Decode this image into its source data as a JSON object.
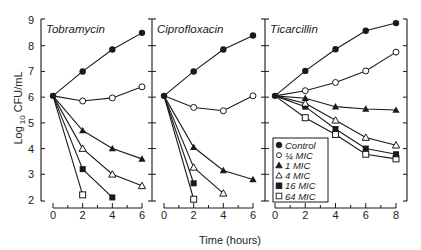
{
  "chart_data": {
    "type": "line",
    "title": "",
    "xlabel": "Time (hours)",
    "ylabel": "Log 10 CFU/mL",
    "ylabel_parts": {
      "prefix": "Log",
      "subscript": "10",
      "suffix": "CFU/mL"
    },
    "ylim": [
      2,
      9
    ],
    "yticks": [
      2,
      3,
      4,
      5,
      6,
      7,
      8,
      9
    ],
    "grid": false,
    "legend_position": "inside lower-left of Ticarcillin panel",
    "series_styles": [
      {
        "name": "Control",
        "marker": "filled-circle"
      },
      {
        "name": "¼ MIC",
        "marker": "open-circle"
      },
      {
        "name": "1 MIC",
        "marker": "filled-triangle"
      },
      {
        "name": "4 MIC",
        "marker": "open-triangle"
      },
      {
        "name": "16 MIC",
        "marker": "filled-square"
      },
      {
        "name": "64 MIC",
        "marker": "open-square"
      }
    ],
    "panels": [
      {
        "title": "Tobramycin",
        "xlim": [
          0,
          6
        ],
        "xticks": [
          0,
          2,
          4,
          6
        ],
        "series": [
          {
            "name": "Control",
            "x": [
              0,
              2,
              4,
              6
            ],
            "values": [
              6.05,
              7.0,
              7.85,
              8.5
            ]
          },
          {
            "name": "¼ MIC",
            "x": [
              0,
              2,
              4,
              6
            ],
            "values": [
              6.05,
              5.85,
              5.97,
              6.4
            ]
          },
          {
            "name": "1 MIC",
            "x": [
              0,
              2,
              4,
              6
            ],
            "values": [
              6.05,
              4.7,
              4.0,
              3.6
            ]
          },
          {
            "name": "4 MIC",
            "x": [
              0,
              2,
              4,
              6
            ],
            "values": [
              6.05,
              4.0,
              3.0,
              2.55
            ]
          },
          {
            "name": "16 MIC",
            "x": [
              0,
              2,
              4
            ],
            "values": [
              6.05,
              3.2,
              2.1
            ]
          },
          {
            "name": "64 MIC",
            "x": [
              0,
              2
            ],
            "values": [
              6.05,
              2.2
            ]
          }
        ]
      },
      {
        "title": "Ciprofloxacin",
        "xlim": [
          0,
          6
        ],
        "xticks": [
          0,
          2,
          4,
          6
        ],
        "series": [
          {
            "name": "Control",
            "x": [
              0,
              2,
              4,
              6
            ],
            "values": [
              6.05,
              7.0,
              7.85,
              8.4
            ]
          },
          {
            "name": "¼ MIC",
            "x": [
              0,
              2,
              4,
              6
            ],
            "values": [
              6.05,
              5.6,
              5.47,
              6.05
            ]
          },
          {
            "name": "1 MIC",
            "x": [
              0,
              2,
              4,
              6
            ],
            "values": [
              6.05,
              4.05,
              3.15,
              2.8
            ]
          },
          {
            "name": "4 MIC",
            "x": [
              0,
              2,
              4
            ],
            "values": [
              6.05,
              3.27,
              2.26
            ]
          },
          {
            "name": "16 MIC",
            "x": [
              0,
              2
            ],
            "values": [
              6.05,
              2.65
            ]
          },
          {
            "name": "64 MIC",
            "x": [
              0,
              2
            ],
            "values": [
              6.05,
              2.03
            ]
          }
        ]
      },
      {
        "title": "Ticarcillin",
        "xlim": [
          0,
          8
        ],
        "xticks": [
          0,
          2,
          4,
          6,
          8
        ],
        "series": [
          {
            "name": "Control",
            "x": [
              0,
              2,
              4,
              6,
              8
            ],
            "values": [
              6.05,
              7.02,
              7.86,
              8.58,
              8.88
            ]
          },
          {
            "name": "¼ MIC",
            "x": [
              0,
              2,
              4,
              6,
              8
            ],
            "values": [
              6.05,
              6.25,
              6.57,
              7.02,
              7.75
            ]
          },
          {
            "name": "1 MIC",
            "x": [
              0,
              2,
              4,
              6,
              8
            ],
            "values": [
              6.05,
              5.96,
              5.63,
              5.54,
              5.5
            ]
          },
          {
            "name": "4 MIC",
            "x": [
              0,
              2,
              4,
              6,
              8
            ],
            "values": [
              6.05,
              5.76,
              5.1,
              4.43,
              4.13
            ]
          },
          {
            "name": "16 MIC",
            "x": [
              0,
              2,
              4,
              6,
              8
            ],
            "values": [
              6.05,
              5.63,
              4.76,
              4.0,
              3.78
            ]
          },
          {
            "name": "64 MIC",
            "x": [
              0,
              2,
              4,
              6,
              8
            ],
            "values": [
              6.05,
              5.2,
              4.55,
              3.78,
              3.6
            ]
          }
        ]
      }
    ]
  },
  "layout": {
    "y_top_px": 20,
    "y_bottom_px": 200,
    "x_axis_line_px": 208,
    "panels_px": [
      {
        "frame_left": 41,
        "frame_right": 152,
        "x0": 53,
        "x1": 142
      },
      {
        "frame_left": 152,
        "frame_right": 265,
        "x0": 164,
        "x1": 253
      },
      {
        "frame_left": 265,
        "frame_right": 407,
        "x0": 275,
        "x1": 396
      }
    ]
  },
  "colors": {
    "ink": "#1a1a1a",
    "background": "#ffffff"
  }
}
